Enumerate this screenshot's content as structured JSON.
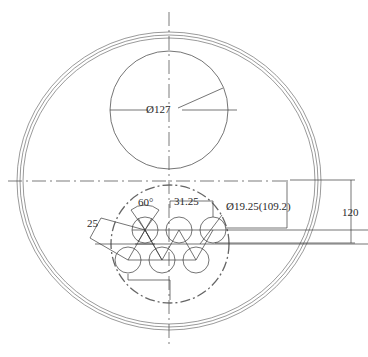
{
  "drawing": {
    "title": "Cross-section of vessel with tube bundle",
    "labels": {
      "outer_dia": "Ø127",
      "tube_dia": "Ø19.25(109.2)",
      "pitch": "31.25",
      "angle": "60°",
      "row_offset": "25",
      "height": "120"
    },
    "colors": {
      "line": "#3a3a3a",
      "background": "#ffffff"
    }
  }
}
